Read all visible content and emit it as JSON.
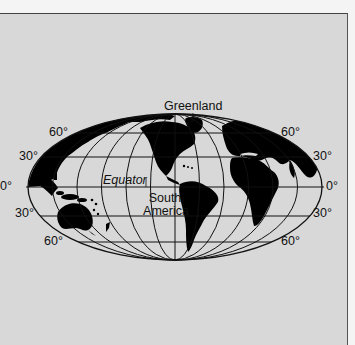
{
  "map": {
    "type": "world-projection",
    "projection": "Mollweide (oval)",
    "colors": {
      "background": "#d8d8d8",
      "land": "#000000",
      "ocean": "#d8d8d8",
      "grid": "#111111",
      "frame": "#444444"
    },
    "labels": {
      "greenland": "Greenland",
      "equator": "Equator",
      "south_america_line1": "South",
      "south_america_line2": "America"
    },
    "latitude_labels": {
      "left": [
        "60°",
        "30°",
        "0°",
        "30°",
        "60°"
      ],
      "right": [
        "60°",
        "30°",
        "0°",
        "30°",
        "60°"
      ]
    },
    "graticule": {
      "parallels_deg": [
        60,
        30,
        0,
        -30,
        -60
      ],
      "meridian_count": 12
    }
  }
}
